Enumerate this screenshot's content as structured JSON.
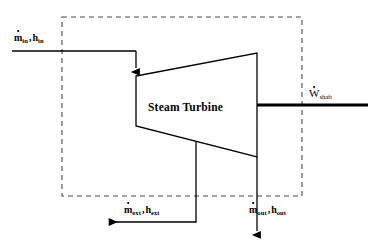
{
  "diagram": {
    "type": "thermodynamic-schematic",
    "component_label": "Steam Turbine",
    "colors": {
      "stroke": "#000000",
      "background": "#ffffff",
      "boundary": "#555555"
    },
    "control_volume": {
      "name": "control-volume-boundary",
      "style": "dashed",
      "x": 62,
      "y": 17,
      "width": 240,
      "height": 179
    },
    "turbine_body": {
      "name": "turbine-trapezoid",
      "points": "136,76 257,53 257,157 136,126"
    },
    "streams": [
      {
        "id": "inlet",
        "symbol_mass": "m",
        "symbol_enthalpy": "h",
        "subscript": "in",
        "label_text": "ṁin , hin",
        "direction": "into-turbine"
      },
      {
        "id": "extraction",
        "symbol_mass": "m",
        "symbol_enthalpy": "h",
        "subscript": "ext",
        "label_text": "ṁext , hext",
        "direction": "out-left"
      },
      {
        "id": "outlet",
        "symbol_mass": "m",
        "symbol_enthalpy": "h",
        "subscript": "out",
        "label_text": "ṁout , hout",
        "direction": "out-down"
      }
    ],
    "work": {
      "id": "shaft-work",
      "symbol": "W",
      "subscript": "shaft",
      "label_text": "Ẇshaft",
      "direction": "out-right"
    }
  }
}
